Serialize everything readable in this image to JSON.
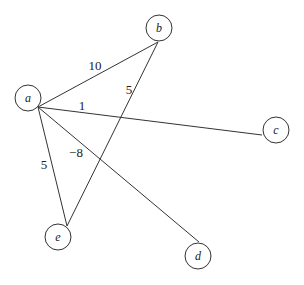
{
  "graph": {
    "nodes": [
      {
        "id": "a",
        "label": "a",
        "x": 28,
        "y": 98
      },
      {
        "id": "b",
        "label": "b",
        "x": 159,
        "y": 28
      },
      {
        "id": "c",
        "label": "c",
        "x": 276,
        "y": 130
      },
      {
        "id": "d",
        "label": "d",
        "x": 198,
        "y": 256
      },
      {
        "id": "e",
        "label": "e",
        "x": 58,
        "y": 237
      }
    ],
    "edges": [
      {
        "from": "a",
        "to": "b",
        "weight": "10",
        "lx": 95,
        "ly": 70
      },
      {
        "from": "a",
        "to": "c",
        "weight": "1",
        "lx": 82,
        "ly": 110
      },
      {
        "from": "a",
        "to": "d",
        "weight": "−8",
        "lx": 75,
        "ly": 155
      },
      {
        "from": "a",
        "to": "e",
        "weight": "5",
        "lx": 44,
        "ly": 168
      },
      {
        "from": "b",
        "to": "e",
        "weight": "5",
        "lx": 129,
        "ly": 93
      }
    ]
  }
}
